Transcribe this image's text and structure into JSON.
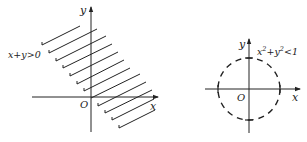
{
  "left_graph": {
    "x_axis_label": "x",
    "y_axis_label": "y",
    "origin_label": "O",
    "region_label": "x+y>0",
    "boundary_line": "x+y=0",
    "boundary_style": "solid-hatched",
    "shaded_side": "upper-right"
  },
  "right_graph": {
    "x_axis_label": "x",
    "y_axis_label": "y",
    "origin_label": "O",
    "region_label_base": "x",
    "region_label_sup1": "2",
    "region_label_mid": "+y",
    "region_label_sup2": "2",
    "region_label_end": "<1",
    "boundary_curve": "x^2+y^2=1",
    "boundary_style": "dashed",
    "radius": 1
  },
  "colors": {
    "ink": "#222222",
    "background": "#ffffff"
  }
}
